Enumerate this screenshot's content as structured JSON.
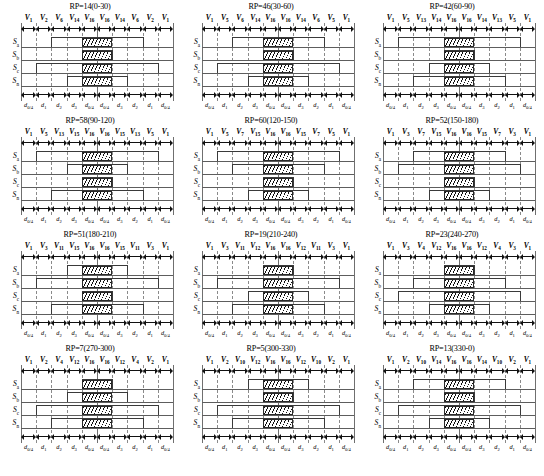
{
  "figure": {
    "caption": "",
    "signal_labels": [
      "S",
      "S",
      "S",
      "S"
    ],
    "signal_subs": [
      "a",
      "b",
      "c",
      "n"
    ],
    "d_labels": [
      "d0/4",
      "d1",
      "d2",
      "d3",
      "d0/4",
      "d0/4",
      "d3",
      "d2",
      "d1",
      "d0/4"
    ],
    "d_main": [
      "d",
      "d",
      "d",
      "d",
      "d",
      "d",
      "d",
      "d",
      "d",
      "d"
    ],
    "d_subs": [
      "0/4",
      "1",
      "2",
      "3",
      "0/4",
      "0/4",
      "3",
      "2",
      "1",
      "0/4"
    ],
    "colors": {
      "line": "#3a3a3a",
      "baseline": "#5d5d5d",
      "dashed_separator": "#8a8a8a",
      "hatch": "#111111",
      "background": "#ffffff"
    }
  },
  "panels": [
    {
      "title": "RP=14(0-30)",
      "rp": 14,
      "range": "0-30",
      "vectors": [
        "V1",
        "V2",
        "V6",
        "V14",
        "V16",
        "V16",
        "V14",
        "V6",
        "V2",
        "V1"
      ],
      "vector_subs": [
        "1",
        "2",
        "6",
        "14",
        "16",
        "16",
        "14",
        "6",
        "2",
        "1"
      ],
      "signals": {
        "Sa": {
          "high_start": 2,
          "high_end": 8,
          "hatch_start": 4,
          "hatch_end": 6
        },
        "Sb": {
          "high_start": 4,
          "high_end": 6,
          "hatch_start": 4,
          "hatch_end": 6
        },
        "Sc": {
          "high_start": 1,
          "high_end": 9,
          "hatch_start": 4,
          "hatch_end": 6
        },
        "Sn": {
          "high_start": 3,
          "high_end": 7,
          "hatch_start": 4,
          "hatch_end": 6
        }
      }
    },
    {
      "title": "RP=46(30-60)",
      "rp": 46,
      "range": "30-60",
      "vectors": [
        "V1",
        "V5",
        "V6",
        "V14",
        "V16",
        "V16",
        "V14",
        "V6",
        "V5",
        "V1"
      ],
      "vector_subs": [
        "1",
        "5",
        "6",
        "14",
        "16",
        "16",
        "14",
        "6",
        "5",
        "1"
      ],
      "signals": {
        "Sa": {
          "high_start": 2,
          "high_end": 8,
          "hatch_start": 4,
          "hatch_end": 6
        },
        "Sb": {
          "high_start": 4,
          "high_end": 6,
          "hatch_start": 4,
          "hatch_end": 6
        },
        "Sc": {
          "high_start": 1,
          "high_end": 9,
          "hatch_start": 4,
          "hatch_end": 6
        },
        "Sn": {
          "high_start": 3,
          "high_end": 7,
          "hatch_start": 4,
          "hatch_end": 6
        }
      }
    },
    {
      "title": "RP=42(60-90)",
      "rp": 42,
      "range": "60-90",
      "vectors": [
        "V1",
        "V5",
        "V13",
        "V14",
        "V16",
        "V16",
        "V14",
        "V13",
        "V5",
        "V1"
      ],
      "vector_subs": [
        "1",
        "5",
        "13",
        "14",
        "16",
        "16",
        "14",
        "13",
        "5",
        "1"
      ],
      "signals": {
        "Sa": {
          "high_start": 1,
          "high_end": 9,
          "hatch_start": 4,
          "hatch_end": 6
        },
        "Sb": {
          "high_start": 4,
          "high_end": 6,
          "hatch_start": 4,
          "hatch_end": 6
        },
        "Sc": {
          "high_start": 3,
          "high_end": 7,
          "hatch_start": 4,
          "hatch_end": 6
        },
        "Sn": {
          "high_start": 2,
          "high_end": 8,
          "hatch_start": 4,
          "hatch_end": 6
        }
      }
    },
    {
      "title": "RP=58(90-120)",
      "rp": 58,
      "range": "90-120",
      "vectors": [
        "V1",
        "V5",
        "V13",
        "V15",
        "V16",
        "V16",
        "V15",
        "V13",
        "V5",
        "V1"
      ],
      "vector_subs": [
        "1",
        "5",
        "13",
        "15",
        "16",
        "16",
        "15",
        "13",
        "5",
        "1"
      ],
      "signals": {
        "Sa": {
          "high_start": 1,
          "high_end": 9,
          "hatch_start": 4,
          "hatch_end": 6
        },
        "Sb": {
          "high_start": 3,
          "high_end": 7,
          "hatch_start": 4,
          "hatch_end": 6
        },
        "Sc": {
          "high_start": 4,
          "high_end": 6,
          "hatch_start": 4,
          "hatch_end": 6
        },
        "Sn": {
          "high_start": 2,
          "high_end": 8,
          "hatch_start": 4,
          "hatch_end": 6
        }
      }
    },
    {
      "title": "RP=60(120-150)",
      "rp": 60,
      "range": "120-150",
      "vectors": [
        "V1",
        "V5",
        "V7",
        "V15",
        "V16",
        "V16",
        "V15",
        "V7",
        "V5",
        "V1"
      ],
      "vector_subs": [
        "1",
        "5",
        "7",
        "15",
        "16",
        "16",
        "15",
        "7",
        "5",
        "1"
      ],
      "signals": {
        "Sa": {
          "high_start": 1,
          "high_end": 9,
          "hatch_start": 4,
          "hatch_end": 6
        },
        "Sb": {
          "high_start": 2,
          "high_end": 8,
          "hatch_start": 4,
          "hatch_end": 6
        },
        "Sc": {
          "high_start": 4,
          "high_end": 6,
          "hatch_start": 4,
          "hatch_end": 6
        },
        "Sn": {
          "high_start": 3,
          "high_end": 7,
          "hatch_start": 4,
          "hatch_end": 6
        }
      }
    },
    {
      "title": "RP=52(150-180)",
      "rp": 52,
      "range": "150-180",
      "vectors": [
        "V1",
        "V3",
        "V7",
        "V15",
        "V16",
        "V16",
        "V15",
        "V7",
        "V3",
        "V1"
      ],
      "vector_subs": [
        "1",
        "3",
        "7",
        "15",
        "16",
        "16",
        "15",
        "7",
        "3",
        "1"
      ],
      "signals": {
        "Sa": {
          "high_start": 2,
          "high_end": 8,
          "hatch_start": 4,
          "hatch_end": 6
        },
        "Sb": {
          "high_start": 1,
          "high_end": 9,
          "hatch_start": 4,
          "hatch_end": 6
        },
        "Sc": {
          "high_start": 4,
          "high_end": 6,
          "hatch_start": 4,
          "hatch_end": 6
        },
        "Sn": {
          "high_start": 3,
          "high_end": 7,
          "hatch_start": 4,
          "hatch_end": 6
        }
      }
    },
    {
      "title": "RP=51(180-210)",
      "rp": 51,
      "range": "180-210",
      "vectors": [
        "V1",
        "V3",
        "V11",
        "V15",
        "V16",
        "V16",
        "V15",
        "V11",
        "V3",
        "V1"
      ],
      "vector_subs": [
        "1",
        "3",
        "11",
        "15",
        "16",
        "16",
        "15",
        "11",
        "3",
        "1"
      ],
      "signals": {
        "Sa": {
          "high_start": 3,
          "high_end": 7,
          "hatch_start": 4,
          "hatch_end": 6
        },
        "Sb": {
          "high_start": 1,
          "high_end": 9,
          "hatch_start": 4,
          "hatch_end": 6
        },
        "Sc": {
          "high_start": 4,
          "high_end": 6,
          "hatch_start": 4,
          "hatch_end": 6
        },
        "Sn": {
          "high_start": 2,
          "high_end": 8,
          "hatch_start": 4,
          "hatch_end": 6
        }
      }
    },
    {
      "title": "RP=19(210-240)",
      "rp": 19,
      "range": "210-240",
      "vectors": [
        "V1",
        "V3",
        "V11",
        "V12",
        "V16",
        "V16",
        "V12",
        "V11",
        "V3",
        "V1"
      ],
      "vector_subs": [
        "1",
        "3",
        "11",
        "12",
        "16",
        "16",
        "12",
        "11",
        "3",
        "1"
      ],
      "signals": {
        "Sa": {
          "high_start": 4,
          "high_end": 6,
          "hatch_start": 4,
          "hatch_end": 6
        },
        "Sb": {
          "high_start": 1,
          "high_end": 9,
          "hatch_start": 4,
          "hatch_end": 6
        },
        "Sc": {
          "high_start": 3,
          "high_end": 7,
          "hatch_start": 4,
          "hatch_end": 6
        },
        "Sn": {
          "high_start": 2,
          "high_end": 8,
          "hatch_start": 4,
          "hatch_end": 6
        }
      }
    },
    {
      "title": "RP=23(240-270)",
      "rp": 23,
      "range": "240-270",
      "vectors": [
        "V1",
        "V3",
        "V4",
        "V12",
        "V16",
        "V16",
        "V12",
        "V4",
        "V3",
        "V1"
      ],
      "vector_subs": [
        "1",
        "3",
        "4",
        "12",
        "16",
        "16",
        "12",
        "4",
        "3",
        "1"
      ],
      "signals": {
        "Sa": {
          "high_start": 4,
          "high_end": 6,
          "hatch_start": 4,
          "hatch_end": 6
        },
        "Sb": {
          "high_start": 2,
          "high_end": 8,
          "hatch_start": 4,
          "hatch_end": 6
        },
        "Sc": {
          "high_start": 1,
          "high_end": 9,
          "hatch_start": 4,
          "hatch_end": 6
        },
        "Sn": {
          "high_start": 3,
          "high_end": 7,
          "hatch_start": 4,
          "hatch_end": 6
        }
      }
    },
    {
      "title": "RP=7(270-300)",
      "rp": 7,
      "range": "270-300",
      "vectors": [
        "V1",
        "V2",
        "V4",
        "V12",
        "V16",
        "V16",
        "V12",
        "V4",
        "V2",
        "V1"
      ],
      "vector_subs": [
        "1",
        "2",
        "4",
        "12",
        "16",
        "16",
        "12",
        "4",
        "2",
        "1"
      ],
      "signals": {
        "Sa": {
          "high_start": 4,
          "high_end": 6,
          "hatch_start": 4,
          "hatch_end": 6
        },
        "Sb": {
          "high_start": 3,
          "high_end": 7,
          "hatch_start": 4,
          "hatch_end": 6
        },
        "Sc": {
          "high_start": 1,
          "high_end": 9,
          "hatch_start": 4,
          "hatch_end": 6
        },
        "Sn": {
          "high_start": 2,
          "high_end": 8,
          "hatch_start": 4,
          "hatch_end": 6
        }
      }
    },
    {
      "title": "RP=5(300-330)",
      "rp": 5,
      "range": "300-330",
      "vectors": [
        "V1",
        "V2",
        "V10",
        "V12",
        "V16",
        "V16",
        "V12",
        "V10",
        "V2",
        "V1"
      ],
      "vector_subs": [
        "1",
        "2",
        "10",
        "12",
        "16",
        "16",
        "12",
        "10",
        "2",
        "1"
      ],
      "signals": {
        "Sa": {
          "high_start": 3,
          "high_end": 7,
          "hatch_start": 4,
          "hatch_end": 6
        },
        "Sb": {
          "high_start": 4,
          "high_end": 6,
          "hatch_start": 4,
          "hatch_end": 6
        },
        "Sc": {
          "high_start": 1,
          "high_end": 9,
          "hatch_start": 4,
          "hatch_end": 6
        },
        "Sn": {
          "high_start": 2,
          "high_end": 8,
          "hatch_start": 4,
          "hatch_end": 6
        }
      }
    },
    {
      "title": "RP=13(330-0)",
      "rp": 13,
      "range": "330-0",
      "vectors": [
        "V1",
        "V2",
        "V10",
        "V14",
        "V16",
        "V16",
        "V14",
        "V10",
        "V2",
        "V1"
      ],
      "vector_subs": [
        "1",
        "2",
        "10",
        "14",
        "16",
        "16",
        "14",
        "10",
        "2",
        "1"
      ],
      "signals": {
        "Sa": {
          "high_start": 2,
          "high_end": 8,
          "hatch_start": 4,
          "hatch_end": 6
        },
        "Sb": {
          "high_start": 4,
          "high_end": 6,
          "hatch_start": 4,
          "hatch_end": 6
        },
        "Sc": {
          "high_start": 1,
          "high_end": 9,
          "hatch_start": 4,
          "hatch_end": 6
        },
        "Sn": {
          "high_start": 3,
          "high_end": 7,
          "hatch_start": 4,
          "hatch_end": 6
        }
      }
    }
  ]
}
